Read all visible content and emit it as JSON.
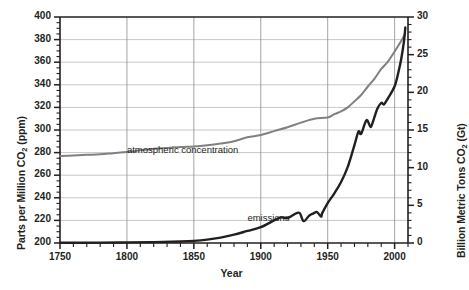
{
  "chart_data": {
    "type": "line",
    "title": "",
    "xlabel": "Year",
    "ylabel_left": "Parts per Million CO2 (ppm)",
    "ylabel_right": "Billion Metric Tons CO2 (Gt)",
    "ylabel_left_prefix": "Parts per Million CO",
    "ylabel_left_sub": "2",
    "ylabel_left_suffix": " (ppm)",
    "ylabel_right_prefix": "Billion Metric Tons CO",
    "ylabel_right_sub": "2",
    "ylabel_right_suffix": " (Gt)",
    "xlim": [
      1750,
      2010
    ],
    "ylim_left": [
      200,
      400
    ],
    "ylim_right": [
      0,
      30
    ],
    "grid": true,
    "legend_position": "inline-annotations",
    "xticks": [
      1750,
      1800,
      1850,
      1900,
      1950,
      2000
    ],
    "yticks_left": [
      200,
      220,
      240,
      260,
      280,
      300,
      320,
      340,
      360,
      380,
      400
    ],
    "yticks_right": [
      0,
      5,
      10,
      15,
      20,
      25,
      30
    ],
    "xminor_step": 10,
    "yminor_left_step": 5,
    "yminor_right_step": 1,
    "annotations": [
      {
        "name": "atmospheric-concentration-label",
        "text": "atmospheric concentration",
        "x": 1800,
        "y": 281
      },
      {
        "name": "emissions-label",
        "text": "emissions",
        "x": 1890,
        "y": 221
      }
    ],
    "series": [
      {
        "name": "atmospheric concentration",
        "unit": "ppm",
        "axis": "left",
        "color": "#808080",
        "x": [
          1750,
          1760,
          1770,
          1780,
          1790,
          1800,
          1810,
          1820,
          1830,
          1840,
          1850,
          1860,
          1870,
          1880,
          1890,
          1900,
          1910,
          1920,
          1930,
          1940,
          1950,
          1955,
          1960,
          1965,
          1970,
          1975,
          1980,
          1985,
          1990,
          1995,
          2000,
          2005,
          2008
        ],
        "values": [
          277,
          277.5,
          278,
          278.5,
          279.5,
          280.5,
          282,
          283.5,
          284,
          285,
          285.5,
          286.5,
          288,
          290,
          293.5,
          295.5,
          299,
          302.5,
          306.5,
          310,
          311,
          314,
          316.5,
          320,
          325.5,
          331,
          338.5,
          345.5,
          354,
          360.5,
          369.5,
          379,
          385.5
        ]
      },
      {
        "name": "emissions",
        "unit": "Gt",
        "axis": "right",
        "color": "#231f20",
        "x": [
          1750,
          1780,
          1800,
          1820,
          1840,
          1850,
          1860,
          1870,
          1880,
          1890,
          1900,
          1910,
          1915,
          1920,
          1925,
          1929,
          1932,
          1936,
          1939,
          1942,
          1945,
          1946,
          1950,
          1955,
          1960,
          1965,
          1970,
          1973,
          1975,
          1979,
          1982,
          1984,
          1987,
          1990,
          1992,
          1995,
          2000,
          2003,
          2005,
          2007,
          2008
        ],
        "values": [
          0.03,
          0.05,
          0.08,
          0.12,
          0.2,
          0.28,
          0.45,
          0.72,
          1.1,
          1.6,
          2.1,
          3.0,
          3.4,
          3.3,
          3.8,
          4.0,
          2.9,
          3.6,
          3.9,
          4.1,
          3.5,
          4.0,
          5.3,
          6.6,
          8.1,
          10.1,
          13.0,
          14.8,
          14.5,
          16.3,
          15.4,
          16.2,
          17.8,
          18.6,
          18.4,
          19.2,
          20.8,
          22.8,
          24.5,
          26.8,
          28.6
        ]
      }
    ]
  }
}
